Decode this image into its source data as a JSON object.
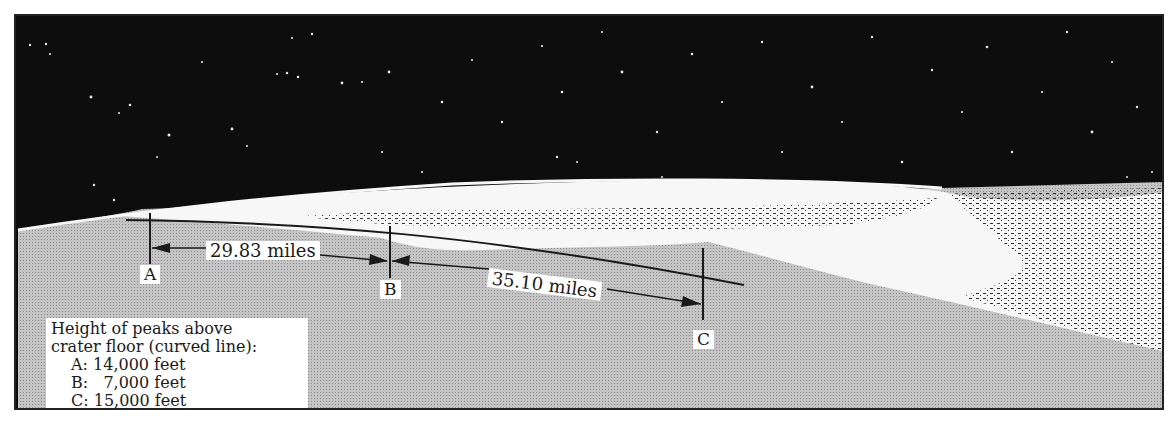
{
  "diagram": {
    "colors": {
      "sky": "#0d0d0d",
      "ground": "#b8b8b8",
      "crater_interior": "#f7f7f7",
      "ink": "#1a1a1a"
    },
    "points": [
      {
        "id": "A",
        "label": "A"
      },
      {
        "id": "B",
        "label": "B"
      },
      {
        "id": "C",
        "label": "C"
      }
    ],
    "distances": [
      {
        "from": "A",
        "to": "B",
        "label": "29.83 miles"
      },
      {
        "from": "B",
        "to": "C",
        "label": "35.10 miles"
      }
    ],
    "legend": {
      "title_line1": "Height of peaks above",
      "title_line2": "crater floor (curved line):",
      "rows": [
        {
          "label": "A:",
          "value": " 14,000 feet"
        },
        {
          "label": "B:",
          "value": "   7,000 feet"
        },
        {
          "label": "C:",
          "value": " 15,000 feet"
        }
      ]
    }
  }
}
